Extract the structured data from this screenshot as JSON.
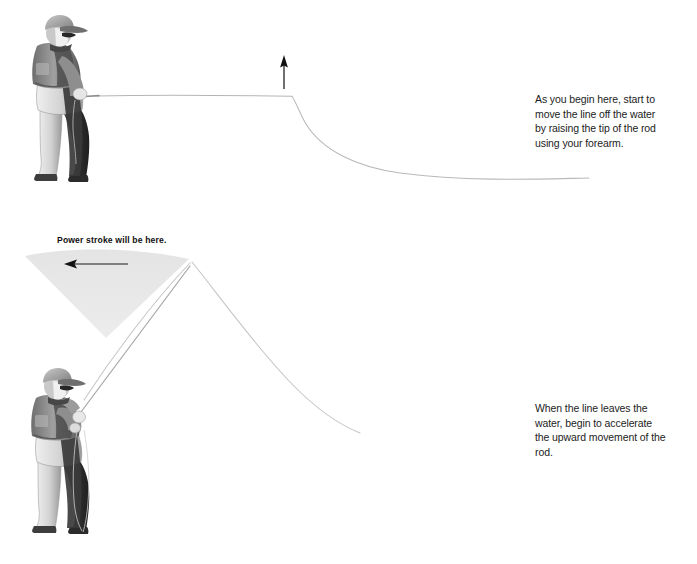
{
  "document": {
    "title": "Fly casting pickup and back cast instruction diagram",
    "background_color": "#ffffff",
    "text_color": "#1c1c1c"
  },
  "panels": [
    {
      "id": "panel-top",
      "name": "pickup-phase",
      "caption": "As you begin here, start to move the line off the water by raising the tip of the rod using your forearm.",
      "figure_label": "angler-rod-horizontal",
      "arrow": {
        "name": "up-arrow",
        "direction": "up",
        "color": "#111111",
        "x": 284,
        "y_top": 56,
        "y_bottom": 89
      },
      "fly_line": {
        "description": "line lying horizontally from rod tip then bending down to the water surface",
        "color": "#b9b9b9"
      }
    },
    {
      "id": "panel-bottom",
      "name": "acceleration-phase",
      "caption": "When the line leaves the water, begin to accelerate the upward movement of the rod.",
      "figure_label": "angler-rod-raised",
      "wedge": {
        "name": "power-stroke-wedge",
        "label": "Power stroke will be here.",
        "fill_color": "#e6e6e6",
        "apex_x": 106,
        "apex_y": 338
      },
      "arrow": {
        "name": "left-arrow",
        "direction": "left",
        "color": "#111111",
        "x_left": 65,
        "x_right": 128,
        "y": 264
      },
      "fly_line": {
        "description": "line rising to a peak above the rod tip then falling away to the right",
        "color": "#c2c2c2"
      }
    }
  ],
  "colors": {
    "line_gray": "#bdbdbd",
    "wedge_gray": "#e6e6e6",
    "arrow_black": "#111111",
    "figure_dark": "#3a3a3a",
    "figure_mid": "#8a8a8a",
    "figure_light": "#d9d9d9"
  }
}
